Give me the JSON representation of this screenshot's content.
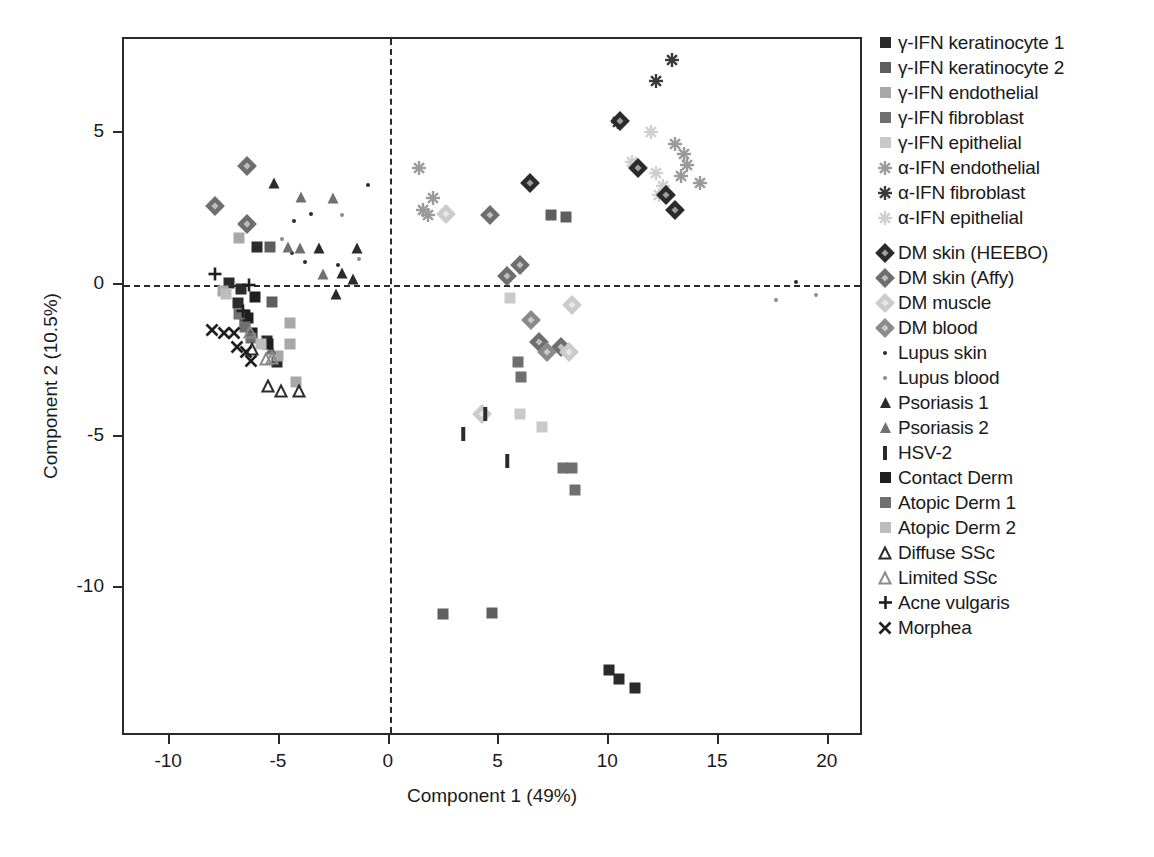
{
  "chart_data": {
    "type": "scatter",
    "title": "",
    "xlabel": "Component 1 (49%)",
    "ylabel": "Component 2 (10.5%)",
    "xlim": [
      -12.1,
      21.6
    ],
    "ylim": [
      -14.9,
      8.1
    ],
    "xticks": [
      -10,
      -5,
      0,
      5,
      10,
      15,
      20
    ],
    "xticklabels": [
      "-10",
      "-5",
      "0",
      "5",
      "10",
      "15",
      "20"
    ],
    "yticks": [
      -10,
      -5,
      0,
      5
    ],
    "yticklabels": [
      "-10",
      "-5",
      "0",
      "5"
    ],
    "grid": false,
    "reference_lines": [
      {
        "axis": "x",
        "value": 0,
        "style": "dashed"
      },
      {
        "axis": "y",
        "value": 0,
        "style": "dashed"
      }
    ],
    "legend_position": "right",
    "series": [
      {
        "name": "γ-IFN keratinocyte 1",
        "marker": "square",
        "color": "#2b2b2b",
        "points": [
          [
            -6.05,
            1.25
          ],
          [
            -7.3,
            0.05
          ],
          [
            -6.75,
            -0.15
          ],
          [
            -6.9,
            -0.6
          ],
          [
            -6.6,
            -1.0
          ],
          [
            -5.6,
            -1.85
          ],
          [
            -5.15,
            -2.55
          ],
          [
            10.0,
            -12.7
          ],
          [
            10.45,
            -13.0
          ],
          [
            11.15,
            -13.3
          ]
        ]
      },
      {
        "name": "γ-IFN keratinocyte 2",
        "marker": "square",
        "color": "#5e5e5e",
        "points": [
          [
            -5.45,
            1.25
          ],
          [
            -5.35,
            -0.55
          ],
          [
            -6.6,
            -1.25
          ],
          [
            7.35,
            2.3
          ],
          [
            8.05,
            2.25
          ],
          [
            2.45,
            -10.85
          ],
          [
            4.65,
            -10.8
          ]
        ]
      },
      {
        "name": "γ-IFN endothelial",
        "marker": "square",
        "color": "#a8a8a8",
        "points": [
          [
            -6.85,
            1.55
          ],
          [
            -7.6,
            -0.2
          ],
          [
            -4.55,
            -1.25
          ],
          [
            -4.55,
            -1.95
          ],
          [
            -5.1,
            -2.35
          ],
          [
            -4.25,
            -3.2
          ]
        ]
      },
      {
        "name": "γ-IFN fibroblast",
        "marker": "square",
        "color": "#6f6f6f",
        "points": [
          [
            5.85,
            -2.55
          ],
          [
            6.0,
            -3.05
          ],
          [
            7.9,
            -6.05
          ],
          [
            8.3,
            -6.05
          ],
          [
            8.45,
            -6.75
          ]
        ]
      },
      {
        "name": "γ-IFN epithelial",
        "marker": "square",
        "color": "#c9c9c9",
        "points": [
          [
            5.5,
            -0.45
          ],
          [
            5.95,
            -4.25
          ],
          [
            6.95,
            -4.7
          ]
        ]
      },
      {
        "name": "α-IFN endothelial",
        "marker": "star",
        "color": "#9a9a9a",
        "points": [
          [
            1.35,
            3.85
          ],
          [
            1.95,
            2.85
          ],
          [
            1.5,
            2.45
          ],
          [
            1.75,
            2.3
          ],
          [
            13.0,
            4.65
          ],
          [
            13.4,
            4.3
          ],
          [
            13.55,
            3.95
          ],
          [
            13.25,
            3.6
          ],
          [
            14.15,
            3.35
          ]
        ]
      },
      {
        "name": "α-IFN fibroblast",
        "marker": "star",
        "color": "#3a3a3a",
        "points": [
          [
            12.85,
            7.4
          ],
          [
            12.15,
            6.7
          ],
          [
            10.4,
            5.35
          ]
        ]
      },
      {
        "name": "α-IFN epithelial",
        "marker": "star",
        "color": "#cfcfcf",
        "points": [
          [
            11.9,
            5.05
          ],
          [
            11.05,
            4.05
          ],
          [
            12.15,
            3.7
          ],
          [
            12.45,
            3.25
          ],
          [
            12.25,
            2.95
          ]
        ]
      },
      {
        "name": "DM skin (HEEBO)",
        "marker": "diamond",
        "color": "#2b2b2b",
        "points": [
          [
            6.4,
            3.35
          ],
          [
            10.5,
            5.4
          ],
          [
            11.3,
            3.85
          ],
          [
            12.6,
            2.95
          ],
          [
            13.0,
            2.45
          ]
        ]
      },
      {
        "name": "DM skin (Affy)",
        "marker": "diamond",
        "color": "#6e6e6e",
        "points": [
          [
            -6.5,
            3.9
          ],
          [
            -7.95,
            2.6
          ],
          [
            -6.5,
            2.0
          ],
          [
            4.55,
            2.3
          ],
          [
            5.95,
            0.65
          ],
          [
            5.35,
            0.3
          ],
          [
            6.8,
            -1.9
          ],
          [
            7.8,
            -2.05
          ]
        ]
      },
      {
        "name": "DM muscle",
        "marker": "diamond",
        "color": "#cbcbcb",
        "points": [
          [
            2.55,
            2.35
          ],
          [
            8.3,
            -0.65
          ],
          [
            8.15,
            -2.2
          ],
          [
            4.2,
            -4.25
          ]
        ]
      },
      {
        "name": "DM blood",
        "marker": "diamond",
        "color": "#8b8b8b",
        "points": [
          [
            6.45,
            -1.15
          ],
          [
            7.15,
            -2.2
          ]
        ]
      },
      {
        "name": "Lupus skin",
        "marker": "dot",
        "color": "#2b2b2b",
        "points": [
          [
            -1.0,
            3.3
          ],
          [
            -3.6,
            2.35
          ],
          [
            -4.35,
            2.1
          ],
          [
            -4.45,
            1.05
          ],
          [
            -3.85,
            0.75
          ],
          [
            -2.35,
            0.65
          ],
          [
            18.5,
            0.1
          ]
        ]
      },
      {
        "name": "Lupus blood",
        "marker": "dot",
        "color": "#8b8b8b",
        "points": [
          [
            -2.15,
            2.3
          ],
          [
            -4.9,
            1.5
          ],
          [
            -1.4,
            0.85
          ],
          [
            19.4,
            -0.35
          ],
          [
            17.6,
            -0.5
          ]
        ]
      },
      {
        "name": "Psoriasis 1",
        "marker": "triangle",
        "color": "#2b2b2b",
        "points": [
          [
            -5.25,
            3.35
          ],
          [
            -3.2,
            1.2
          ],
          [
            -1.5,
            1.2
          ],
          [
            -2.15,
            0.4
          ],
          [
            -1.65,
            0.2
          ],
          [
            -2.45,
            -0.3
          ]
        ]
      },
      {
        "name": "Psoriasis 2",
        "marker": "triangle",
        "color": "#707070",
        "points": [
          [
            -4.05,
            2.9
          ],
          [
            -2.6,
            2.85
          ],
          [
            -4.65,
            1.25
          ],
          [
            -4.1,
            1.2
          ],
          [
            -3.05,
            0.35
          ],
          [
            -5.4,
            -2.1
          ]
        ]
      },
      {
        "name": "HSV-2",
        "marker": "bar",
        "color": "#2b2b2b",
        "points": [
          [
            3.35,
            -4.9
          ],
          [
            4.35,
            -4.25
          ],
          [
            5.35,
            -5.8
          ]
        ]
      },
      {
        "name": "Contact Derm",
        "marker": "square",
        "color": "#1f1f1f",
        "points": [
          [
            -6.15,
            -0.4
          ],
          [
            -6.45,
            -1.1
          ],
          [
            -6.25,
            -1.6
          ],
          [
            -5.55,
            -1.95
          ]
        ]
      },
      {
        "name": "Atopic Derm 1",
        "marker": "square",
        "color": "#707070",
        "points": [
          [
            -6.85,
            -0.95
          ],
          [
            -6.6,
            -1.4
          ],
          [
            -6.3,
            -1.75
          ]
        ]
      },
      {
        "name": "Atopic Derm 2",
        "marker": "square",
        "color": "#bdbdbd",
        "points": [
          [
            -7.45,
            -0.3
          ],
          [
            -5.85,
            -1.95
          ]
        ]
      },
      {
        "name": "Diffuse SSc",
        "marker": "triangle-open",
        "color": "#2b2b2b",
        "points": [
          [
            -6.25,
            -2.1
          ],
          [
            -5.55,
            -3.35
          ],
          [
            -4.95,
            -3.5
          ],
          [
            -4.15,
            -3.5
          ]
        ]
      },
      {
        "name": "Limited SSc",
        "marker": "triangle-open",
        "color": "#8b8b8b",
        "points": [
          [
            -6.35,
            -1.55
          ],
          [
            -5.65,
            -2.45
          ],
          [
            -5.35,
            -2.4
          ]
        ]
      },
      {
        "name": "Acne vulgaris",
        "marker": "plus",
        "color": "#1f1f1f",
        "points": [
          [
            -7.95,
            0.35
          ],
          [
            -6.4,
            0.0
          ],
          [
            -6.7,
            -0.85
          ]
        ]
      },
      {
        "name": "Morphea",
        "marker": "x",
        "color": "#1f1f1f",
        "points": [
          [
            -8.1,
            -1.5
          ],
          [
            -7.55,
            -1.6
          ],
          [
            -7.1,
            -1.6
          ],
          [
            -6.95,
            -2.05
          ],
          [
            -6.55,
            -2.2
          ],
          [
            -6.3,
            -2.5
          ]
        ]
      }
    ]
  },
  "legend": {
    "groups": [
      {
        "id": "ifn-cell-lines",
        "entries": [
          {
            "label": "γ-IFN keratinocyte 1",
            "marker": "square",
            "color": "#2b2b2b"
          },
          {
            "label": "γ-IFN keratinocyte 2",
            "marker": "square",
            "color": "#5e5e5e"
          },
          {
            "label": "γ-IFN endothelial",
            "marker": "square",
            "color": "#a8a8a8"
          },
          {
            "label": "γ-IFN fibroblast",
            "marker": "square",
            "color": "#6f6f6f"
          },
          {
            "label": "γ-IFN epithelial",
            "marker": "square",
            "color": "#c9c9c9"
          },
          {
            "label": "α-IFN endothelial",
            "marker": "star",
            "color": "#9a9a9a"
          },
          {
            "label": "α-IFN fibroblast",
            "marker": "star",
            "color": "#3a3a3a"
          },
          {
            "label": "α-IFN epithelial",
            "marker": "star",
            "color": "#cfcfcf"
          }
        ]
      },
      {
        "id": "disease-samples",
        "entries": [
          {
            "label": "DM skin (HEEBO)",
            "marker": "diamond",
            "color": "#2b2b2b"
          },
          {
            "label": "DM skin (Affy)",
            "marker": "diamond",
            "color": "#6e6e6e"
          },
          {
            "label": "DM muscle",
            "marker": "diamond",
            "color": "#cbcbcb"
          },
          {
            "label": "DM blood",
            "marker": "diamond",
            "color": "#8b8b8b"
          },
          {
            "label": "Lupus skin",
            "marker": "dot",
            "color": "#2b2b2b"
          },
          {
            "label": "Lupus blood",
            "marker": "dot",
            "color": "#8b8b8b"
          },
          {
            "label": "Psoriasis 1",
            "marker": "triangle",
            "color": "#2b2b2b"
          },
          {
            "label": "Psoriasis 2",
            "marker": "triangle",
            "color": "#707070"
          },
          {
            "label": "HSV-2",
            "marker": "bar",
            "color": "#2b2b2b"
          },
          {
            "label": "Contact Derm",
            "marker": "square",
            "color": "#1f1f1f"
          },
          {
            "label": "Atopic Derm 1",
            "marker": "square",
            "color": "#707070"
          },
          {
            "label": "Atopic Derm 2",
            "marker": "square",
            "color": "#bdbdbd"
          },
          {
            "label": "Diffuse SSc",
            "marker": "triangle-open",
            "color": "#2b2b2b"
          },
          {
            "label": "Limited SSc",
            "marker": "triangle-open",
            "color": "#8b8b8b"
          },
          {
            "label": "Acne vulgaris",
            "marker": "plus",
            "color": "#1f1f1f"
          },
          {
            "label": "Morphea",
            "marker": "x",
            "color": "#1f1f1f"
          }
        ]
      }
    ]
  },
  "colors": {
    "axis": "#2a2a2a",
    "text": "#1a1a1a",
    "background": "#ffffff"
  }
}
